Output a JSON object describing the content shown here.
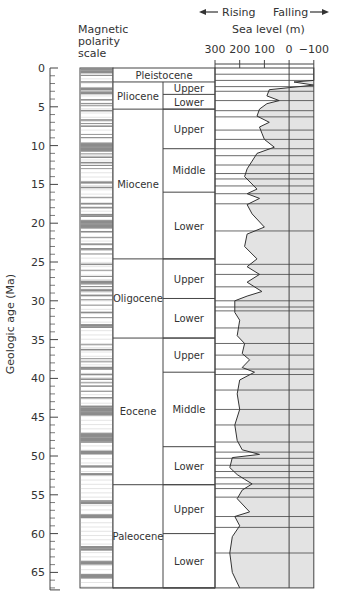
{
  "chart_data": {
    "type": "line",
    "ylabel": "Geologic age (Ma)",
    "y_ticks": [
      0,
      5,
      10,
      15,
      20,
      25,
      30,
      35,
      40,
      45,
      50,
      55,
      60,
      65
    ],
    "ylim": [
      0,
      67
    ],
    "polarity_label": [
      "Magnetic",
      "polarity",
      "scale"
    ],
    "sea_level": {
      "label": "Sea level (m)",
      "rising_label": "Rising",
      "falling_label": "Falling",
      "x_ticks": [
        300,
        200,
        100,
        0,
        -100
      ],
      "xlim": [
        300,
        -100
      ],
      "curve": [
        {
          "age": 0.0,
          "m": -100
        },
        {
          "age": 1.6,
          "m": -100
        },
        {
          "age": 1.8,
          "m": -20
        },
        {
          "age": 2.2,
          "m": -100
        },
        {
          "age": 2.8,
          "m": 80
        },
        {
          "age": 3.6,
          "m": 90
        },
        {
          "age": 4.2,
          "m": 40
        },
        {
          "age": 4.6,
          "m": 90
        },
        {
          "age": 5.3,
          "m": 120
        },
        {
          "age": 6.2,
          "m": 130
        },
        {
          "age": 7.0,
          "m": 80
        },
        {
          "age": 7.6,
          "m": 120
        },
        {
          "age": 8.4,
          "m": 110
        },
        {
          "age": 9.2,
          "m": 100
        },
        {
          "age": 10.2,
          "m": 60
        },
        {
          "age": 11.0,
          "m": 130
        },
        {
          "age": 12.0,
          "m": 150
        },
        {
          "age": 13.0,
          "m": 170
        },
        {
          "age": 14.0,
          "m": 180
        },
        {
          "age": 15.6,
          "m": 130
        },
        {
          "age": 16.2,
          "m": 170
        },
        {
          "age": 16.8,
          "m": 120
        },
        {
          "age": 17.6,
          "m": 170
        },
        {
          "age": 18.8,
          "m": 150
        },
        {
          "age": 20.5,
          "m": 100
        },
        {
          "age": 21.4,
          "m": 170
        },
        {
          "age": 23.0,
          "m": 180
        },
        {
          "age": 24.6,
          "m": 130
        },
        {
          "age": 25.6,
          "m": 170
        },
        {
          "age": 26.6,
          "m": 120
        },
        {
          "age": 27.6,
          "m": 170
        },
        {
          "age": 28.8,
          "m": 110
        },
        {
          "age": 29.4,
          "m": 170
        },
        {
          "age": 30.0,
          "m": 220
        },
        {
          "age": 31.5,
          "m": 220
        },
        {
          "age": 32.5,
          "m": 200
        },
        {
          "age": 34.5,
          "m": 210
        },
        {
          "age": 35.5,
          "m": 180
        },
        {
          "age": 36.8,
          "m": 190
        },
        {
          "age": 37.6,
          "m": 160
        },
        {
          "age": 38.6,
          "m": 190
        },
        {
          "age": 39.2,
          "m": 140
        },
        {
          "age": 40.2,
          "m": 200
        },
        {
          "age": 42.0,
          "m": 210
        },
        {
          "age": 44.0,
          "m": 200
        },
        {
          "age": 46.0,
          "m": 220
        },
        {
          "age": 48.0,
          "m": 210
        },
        {
          "age": 49.2,
          "m": 190
        },
        {
          "age": 49.8,
          "m": 120
        },
        {
          "age": 50.2,
          "m": 230
        },
        {
          "age": 51.5,
          "m": 240
        },
        {
          "age": 52.4,
          "m": 210
        },
        {
          "age": 53.0,
          "m": 180
        },
        {
          "age": 53.6,
          "m": 150
        },
        {
          "age": 54.4,
          "m": 190
        },
        {
          "age": 55.5,
          "m": 210
        },
        {
          "age": 57.2,
          "m": 160
        },
        {
          "age": 57.8,
          "m": 220
        },
        {
          "age": 59.0,
          "m": 200
        },
        {
          "age": 60.4,
          "m": 230
        },
        {
          "age": 62.5,
          "m": 240
        },
        {
          "age": 65.0,
          "m": 230
        },
        {
          "age": 67.0,
          "m": 200
        }
      ]
    },
    "epochs": [
      {
        "name": "Pleistocene",
        "start": 0,
        "end": 1.8,
        "subdivisions": []
      },
      {
        "name": "Pliocene",
        "start": 1.8,
        "end": 5.3,
        "subdivisions": [
          {
            "name": "Upper",
            "start": 1.8,
            "end": 3.4
          },
          {
            "name": "Lower",
            "start": 3.4,
            "end": 5.3
          }
        ]
      },
      {
        "name": "Miocene",
        "start": 5.3,
        "end": 24.6,
        "subdivisions": [
          {
            "name": "Upper",
            "start": 5.3,
            "end": 10.4
          },
          {
            "name": "Middle",
            "start": 10.4,
            "end": 16.0
          },
          {
            "name": "Lower",
            "start": 16.0,
            "end": 24.6
          }
        ]
      },
      {
        "name": "Oligocene",
        "start": 24.6,
        "end": 34.8,
        "subdivisions": [
          {
            "name": "Upper",
            "start": 24.6,
            "end": 29.7
          },
          {
            "name": "Lower",
            "start": 29.7,
            "end": 34.8
          }
        ]
      },
      {
        "name": "Eocene",
        "start": 34.8,
        "end": 53.7,
        "subdivisions": [
          {
            "name": "Upper",
            "start": 34.8,
            "end": 39.2
          },
          {
            "name": "Middle",
            "start": 39.2,
            "end": 48.8
          },
          {
            "name": "Lower",
            "start": 48.8,
            "end": 53.7
          }
        ]
      },
      {
        "name": "Paleocene",
        "start": 53.7,
        "end": 67,
        "subdivisions": [
          {
            "name": "Upper",
            "start": 53.7,
            "end": 60.0
          },
          {
            "name": "Lower",
            "start": 60.0,
            "end": 67
          }
        ]
      }
    ],
    "sequence_boundaries": [
      0.8,
      1.6,
      2.4,
      3.0,
      4.2,
      5.5,
      6.3,
      8.0,
      9.2,
      10.4,
      11.3,
      12.5,
      13.6,
      14.3,
      15.2,
      16.2,
      17.5,
      21.0,
      25.3,
      26.6,
      28.2,
      30.0,
      30.8,
      31.3,
      33.5,
      35.5,
      37.0,
      38.8,
      39.5,
      41.5,
      44.0,
      46.0,
      48.2,
      49.5,
      50.3,
      51.2,
      52.0,
      52.8,
      53.6,
      54.2,
      55.3,
      57.8,
      59.2,
      62.5
    ],
    "polarity_normal": [
      [
        0,
        0.7
      ],
      [
        0.9,
        1.0
      ],
      [
        1.7,
        1.9
      ],
      [
        2.5,
        2.9
      ],
      [
        3.0,
        3.4
      ],
      [
        4.0,
        4.2
      ],
      [
        4.5,
        4.6
      ],
      [
        4.8,
        4.9
      ],
      [
        5.4,
        5.6
      ],
      [
        6.6,
        6.8
      ],
      [
        7.1,
        7.2
      ],
      [
        7.4,
        7.6
      ],
      [
        8.5,
        8.6
      ],
      [
        8.9,
        9.0
      ],
      [
        9.6,
        10.8
      ],
      [
        11.0,
        11.1
      ],
      [
        11.4,
        11.6
      ],
      [
        12.1,
        12.3
      ],
      [
        12.5,
        12.6
      ],
      [
        12.9,
        13.0
      ],
      [
        14.6,
        14.9
      ],
      [
        15.3,
        15.5
      ],
      [
        16.6,
        16.7
      ],
      [
        17.4,
        17.6
      ],
      [
        17.9,
        18.1
      ],
      [
        18.8,
        19.2
      ],
      [
        19.6,
        20.7
      ],
      [
        21.0,
        21.2
      ],
      [
        21.8,
        21.9
      ],
      [
        22.6,
        22.8
      ],
      [
        23.2,
        23.5
      ],
      [
        23.9,
        24.0
      ],
      [
        25.2,
        25.4
      ],
      [
        26.0,
        26.1
      ],
      [
        26.8,
        26.9
      ],
      [
        27.4,
        27.9
      ],
      [
        28.1,
        28.2
      ],
      [
        28.5,
        28.8
      ],
      [
        29.2,
        29.4
      ],
      [
        29.8,
        29.9
      ],
      [
        30.5,
        30.6
      ],
      [
        31.4,
        31.6
      ],
      [
        32.1,
        32.2
      ],
      [
        33.0,
        33.5
      ],
      [
        35.6,
        35.7
      ],
      [
        36.2,
        36.4
      ],
      [
        37.4,
        37.5
      ],
      [
        37.8,
        37.9
      ],
      [
        38.5,
        38.9
      ],
      [
        39.4,
        39.6
      ],
      [
        40.0,
        40.2
      ],
      [
        40.5,
        40.6
      ],
      [
        40.9,
        41.1
      ],
      [
        41.6,
        41.7
      ],
      [
        42.4,
        42.6
      ],
      [
        43.5,
        44.8
      ],
      [
        47.0,
        48.3
      ],
      [
        49.3,
        49.8
      ],
      [
        51.2,
        51.5
      ],
      [
        52.2,
        52.5
      ],
      [
        55.7,
        56.2
      ],
      [
        57.5,
        58.0
      ],
      [
        61.6,
        62.2
      ],
      [
        63.5,
        64.0
      ],
      [
        65.2,
        65.8
      ]
    ]
  }
}
